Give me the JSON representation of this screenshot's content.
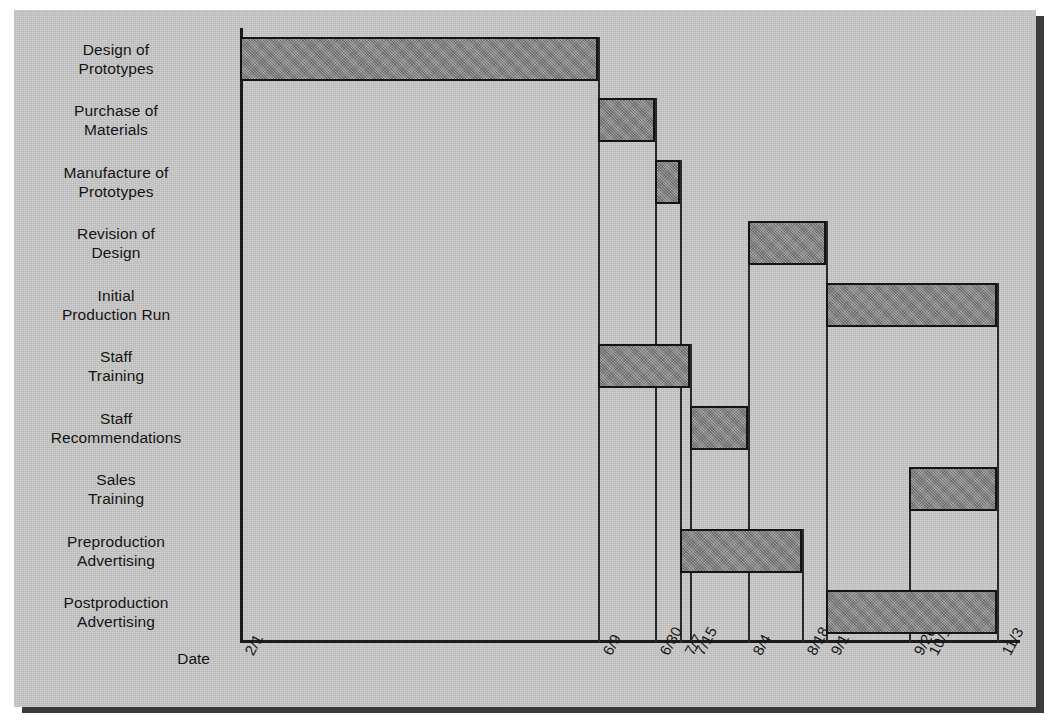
{
  "chart_data": {
    "type": "bar",
    "chart_kind": "gantt",
    "title": "",
    "xlabel": "Date",
    "ylabel": "",
    "grid": true,
    "legend": null,
    "x_axis_ticks": [
      "2/1",
      "6/9",
      "6/30",
      "7/7",
      "7/15",
      "8/4",
      "8/18",
      "9/1",
      "9/26",
      "10/1",
      "11/3"
    ],
    "categories": [
      "Design of Prototypes",
      "Purchase of Materials",
      "Manufacture of Prototypes",
      "Revision of Design",
      "Initial Production Run",
      "Staff Training",
      "Staff Recommendations",
      "Sales Training",
      "Preproduction Advertising",
      "Postproduction Advertising"
    ],
    "tasks": [
      {
        "name": "Design of Prototypes",
        "start": "2/1",
        "end": "6/9"
      },
      {
        "name": "Purchase of Materials",
        "start": "6/9",
        "end": "6/30"
      },
      {
        "name": "Manufacture of Prototypes",
        "start": "6/30",
        "end": "7/7"
      },
      {
        "name": "Revision of Design",
        "start": "8/4",
        "end": "9/1"
      },
      {
        "name": "Initial Production Run",
        "start": "9/1",
        "end": "11/3"
      },
      {
        "name": "Staff Training",
        "start": "6/9",
        "end": "7/15"
      },
      {
        "name": "Staff Recommendations",
        "start": "7/15",
        "end": "8/4"
      },
      {
        "name": "Sales Training",
        "start": "9/26",
        "end": "11/3"
      },
      {
        "name": "Preproduction Advertising",
        "start": "7/7",
        "end": "8/18"
      },
      {
        "name": "Postproduction Advertising",
        "start": "9/1",
        "end": "11/3"
      }
    ]
  },
  "chart": {
    "axis_title": "Date",
    "rows": [
      {
        "line1": "Design of",
        "line2": "Prototypes"
      },
      {
        "line1": "Purchase of",
        "line2": "Materials"
      },
      {
        "line1": "Manufacture of",
        "line2": "Prototypes"
      },
      {
        "line1": "Revision of",
        "line2": "Design"
      },
      {
        "line1": "Initial",
        "line2": "Production Run"
      },
      {
        "line1": "Staff",
        "line2": "Training"
      },
      {
        "line1": "Staff",
        "line2": "Recommendations"
      },
      {
        "line1": "Sales",
        "line2": "Training"
      },
      {
        "line1": "Preproduction",
        "line2": "Advertising"
      },
      {
        "line1": "Postproduction",
        "line2": "Advertising"
      }
    ],
    "dates": [
      {
        "label": "2/1",
        "x": 240
      },
      {
        "label": "6/9",
        "x": 598
      },
      {
        "label": "6/30",
        "x": 655
      },
      {
        "label": "7/7",
        "x": 680
      },
      {
        "label": "7/15",
        "x": 690
      },
      {
        "label": "8/4",
        "x": 748
      },
      {
        "label": "8/18",
        "x": 802
      },
      {
        "label": "9/1",
        "x": 826
      },
      {
        "label": "9/26",
        "x": 909
      },
      {
        "label": "10/1",
        "x": 924
      },
      {
        "label": "11/3",
        "x": 997
      }
    ],
    "colors": {
      "bar_fill": "#8d8d8d",
      "bar_border": "#141414",
      "paper": "#c9c9c9",
      "ink": "#141414"
    }
  }
}
